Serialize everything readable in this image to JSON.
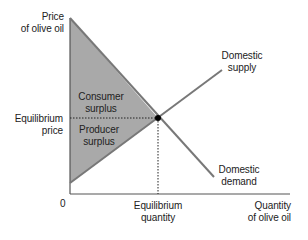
{
  "diagram": {
    "type": "supply-demand",
    "y_axis": {
      "label_line1": "Price",
      "label_line2": "of olive oil"
    },
    "x_axis": {
      "label_line1": "Quantity",
      "label_line2": "of olive oil",
      "origin": "0"
    },
    "equilibrium_price": {
      "line1": "Equilibrium",
      "line2": "price"
    },
    "equilibrium_quantity": {
      "line1": "Equilibrium",
      "line2": "quantity"
    },
    "supply": {
      "line1": "Domestic",
      "line2": "supply"
    },
    "demand": {
      "line1": "Domestic",
      "line2": "demand"
    },
    "consumer_surplus": {
      "line1": "Consumer",
      "line2": "surplus"
    },
    "producer_surplus": {
      "line1": "Producer",
      "line2": "surplus"
    },
    "colors": {
      "surplus_fill": "#a9a9a9",
      "curve": "#787878",
      "axis": "#555555",
      "equilibrium_point": "#000000"
    }
  }
}
